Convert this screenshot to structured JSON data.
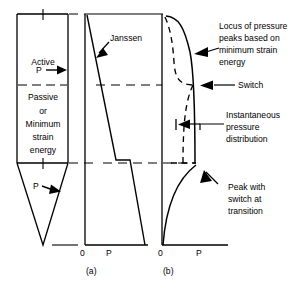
{
  "figure": {
    "type": "engineering-diagram",
    "title_parts": {
      "panel_a": "(a)",
      "panel_b": "(b)"
    },
    "silo": {
      "zone_top_label": "Active",
      "zone_bottom_label_lines": [
        "Passive",
        "or",
        "Minimum",
        "strain",
        "energy"
      ],
      "pressure_symbol_upper": "P",
      "pressure_symbol_lower": "P",
      "arrow_glyph": "→"
    },
    "panel_a": {
      "axis_origin_label": "0",
      "axis_value_label": "P",
      "caption": "(a)",
      "curve_label": "Janssen"
    },
    "panel_b": {
      "axis_origin_label": "0",
      "axis_value_label": "P",
      "caption": "(b)",
      "annotations": [
        {
          "name": "locus-of-pressure-peaks",
          "lines": [
            "Locus of pressure",
            "peaks based on",
            "minimum strain",
            "energy"
          ]
        },
        {
          "name": "switch",
          "lines": [
            "Switch"
          ]
        },
        {
          "name": "instantaneous-pressure-distribution",
          "lines": [
            "Instantaneous",
            "pressure",
            "distribution"
          ]
        },
        {
          "name": "peak-with-switch-at-transition",
          "lines": [
            "Peak with",
            "switch at",
            "transition"
          ]
        }
      ]
    },
    "colors": {
      "stroke": "#000000",
      "background": "#ffffff"
    }
  }
}
